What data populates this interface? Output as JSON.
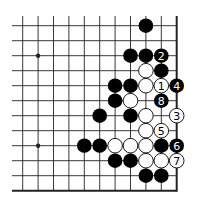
{
  "diagram": {
    "type": "go-board-fragment",
    "colors": {
      "line": "#222222",
      "black_stone": "#000000",
      "white_stone": "#ffffff",
      "background": "#ffffff"
    },
    "grid": {
      "columns": 11,
      "rows": 12,
      "origin_x": 22.7,
      "origin_y": 25.7,
      "spacing_x": 15.4,
      "spacing_y": 15.0,
      "open_left_to_x": 12,
      "open_top_to_y": 16,
      "edges": [
        "right",
        "bottom"
      ]
    },
    "hoshi": [
      {
        "col": 1,
        "row": 2
      },
      {
        "col": 1,
        "row": 8
      }
    ],
    "stones": [
      {
        "col": 8,
        "row": 0,
        "color": "black",
        "label": ""
      },
      {
        "col": 7,
        "row": 2,
        "color": "black",
        "label": ""
      },
      {
        "col": 8,
        "row": 2,
        "color": "black",
        "label": ""
      },
      {
        "col": 9,
        "row": 2,
        "color": "black",
        "label": "2"
      },
      {
        "col": 8,
        "row": 3,
        "color": "white",
        "label": ""
      },
      {
        "col": 9,
        "row": 3,
        "color": "black",
        "label": ""
      },
      {
        "col": 6,
        "row": 4,
        "color": "black",
        "label": ""
      },
      {
        "col": 7,
        "row": 4,
        "color": "black",
        "label": ""
      },
      {
        "col": 8,
        "row": 4,
        "color": "white",
        "label": ""
      },
      {
        "col": 9,
        "row": 4,
        "color": "white",
        "label": "1"
      },
      {
        "col": 10,
        "row": 4,
        "color": "black",
        "label": "4"
      },
      {
        "col": 6,
        "row": 5,
        "color": "black",
        "label": ""
      },
      {
        "col": 7,
        "row": 5,
        "color": "white",
        "label": ""
      },
      {
        "col": 9,
        "row": 5,
        "color": "black",
        "label": "8"
      },
      {
        "col": 5,
        "row": 6,
        "color": "black",
        "label": ""
      },
      {
        "col": 7,
        "row": 6,
        "color": "black",
        "label": ""
      },
      {
        "col": 8,
        "row": 6,
        "color": "white",
        "label": ""
      },
      {
        "col": 10,
        "row": 6,
        "color": "white",
        "label": "3"
      },
      {
        "col": 8,
        "row": 7,
        "color": "white",
        "label": ""
      },
      {
        "col": 9,
        "row": 7,
        "color": "white",
        "label": "5"
      },
      {
        "col": 4,
        "row": 8,
        "color": "black",
        "label": ""
      },
      {
        "col": 5,
        "row": 8,
        "color": "black",
        "label": ""
      },
      {
        "col": 6,
        "row": 8,
        "color": "white",
        "label": ""
      },
      {
        "col": 7,
        "row": 8,
        "color": "white",
        "label": ""
      },
      {
        "col": 8,
        "row": 8,
        "color": "white",
        "label": ""
      },
      {
        "col": 9,
        "row": 8,
        "color": "black",
        "label": ""
      },
      {
        "col": 10,
        "row": 8,
        "color": "black",
        "label": "6"
      },
      {
        "col": 6,
        "row": 9,
        "color": "black",
        "label": ""
      },
      {
        "col": 7,
        "row": 9,
        "color": "black",
        "label": ""
      },
      {
        "col": 8,
        "row": 9,
        "color": "white",
        "label": ""
      },
      {
        "col": 9,
        "row": 9,
        "color": "white",
        "label": ""
      },
      {
        "col": 10,
        "row": 9,
        "color": "white",
        "label": "7"
      },
      {
        "col": 8,
        "row": 10,
        "color": "black",
        "label": ""
      },
      {
        "col": 9,
        "row": 10,
        "color": "black",
        "label": ""
      }
    ]
  }
}
